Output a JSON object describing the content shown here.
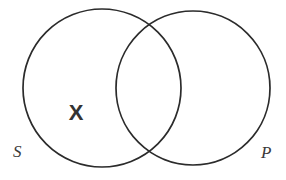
{
  "figure": {
    "type": "venn-diagram",
    "subject_term": "S",
    "predicate_term": "P",
    "x_mark": "X",
    "background_color": "#ffffff",
    "stroke_color": "#2b2b2b",
    "label_color": "#3a3a3a",
    "x_mark_color": "#333333"
  },
  "chart_data": {
    "type": "diagram",
    "title": "",
    "diagram_kind": "two-circle Venn diagram",
    "circles": [
      {
        "label": "S",
        "cx": 102,
        "cy": 88,
        "r": 79,
        "label_x": 13,
        "label_y": 143
      },
      {
        "label": "P",
        "cx": 193,
        "cy": 88,
        "r": 77,
        "label_x": 261,
        "label_y": 144
      }
    ],
    "marks": [
      {
        "symbol": "X",
        "region": "S-only",
        "x": 75,
        "y": 113
      }
    ],
    "legend": [],
    "grid": false
  }
}
